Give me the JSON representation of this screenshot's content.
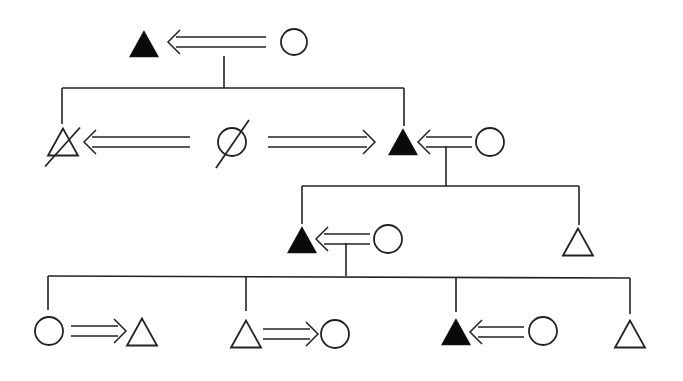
{
  "diagram": {
    "title": "",
    "type": "kinship-pedigree",
    "colors": {
      "stroke": "#222222",
      "filled": "#0a0a0a",
      "background": "#ffffff"
    },
    "nodes": [
      {
        "id": "g1-male",
        "shape": "triangle",
        "filled": true,
        "deceased": false,
        "cx": 144,
        "cy": 44,
        "size": 28
      },
      {
        "id": "g1-female",
        "shape": "circle",
        "filled": false,
        "deceased": false,
        "cx": 294,
        "cy": 42,
        "r": 13
      },
      {
        "id": "g2-male-left",
        "shape": "triangle",
        "filled": false,
        "deceased": true,
        "cx": 63,
        "cy": 142,
        "size": 30
      },
      {
        "id": "g2-female-mid",
        "shape": "circle",
        "filled": false,
        "deceased": true,
        "cx": 232,
        "cy": 142,
        "r": 14
      },
      {
        "id": "g2-male-right",
        "shape": "triangle",
        "filled": true,
        "deceased": false,
        "cx": 403,
        "cy": 142,
        "size": 28
      },
      {
        "id": "g2-female-right",
        "shape": "circle",
        "filled": false,
        "deceased": false,
        "cx": 490,
        "cy": 142,
        "r": 14
      },
      {
        "id": "g3-male-left",
        "shape": "triangle",
        "filled": true,
        "deceased": false,
        "cx": 302,
        "cy": 240,
        "size": 28
      },
      {
        "id": "g3-female-left",
        "shape": "circle",
        "filled": false,
        "deceased": false,
        "cx": 388,
        "cy": 239,
        "r": 14
      },
      {
        "id": "g3-male-right",
        "shape": "triangle",
        "filled": false,
        "deceased": false,
        "cx": 578,
        "cy": 242,
        "size": 30
      },
      {
        "id": "g4-female-1",
        "shape": "circle",
        "filled": false,
        "deceased": false,
        "cx": 49,
        "cy": 331,
        "r": 14
      },
      {
        "id": "g4-male-1",
        "shape": "triangle",
        "filled": false,
        "deceased": false,
        "cx": 142,
        "cy": 332,
        "size": 30
      },
      {
        "id": "g4-male-2",
        "shape": "triangle",
        "filled": false,
        "deceased": false,
        "cx": 246,
        "cy": 334,
        "size": 30
      },
      {
        "id": "g4-female-2",
        "shape": "circle",
        "filled": false,
        "deceased": false,
        "cx": 335,
        "cy": 334,
        "r": 14
      },
      {
        "id": "g4-male-3",
        "shape": "triangle",
        "filled": true,
        "deceased": false,
        "cx": 456,
        "cy": 332,
        "size": 28
      },
      {
        "id": "g4-female-3",
        "shape": "circle",
        "filled": false,
        "deceased": false,
        "cx": 543,
        "cy": 331,
        "r": 14
      },
      {
        "id": "g4-male-4",
        "shape": "triangle",
        "filled": false,
        "deceased": false,
        "cx": 630,
        "cy": 334,
        "size": 30
      }
    ],
    "arrows": [
      {
        "id": "arrow-g1",
        "direction": "left",
        "x1": 168,
        "x2": 266,
        "y": 42,
        "gap": 10
      },
      {
        "id": "arrow-g2-left",
        "direction": "left",
        "x1": 84,
        "x2": 190,
        "y": 142,
        "gap": 10
      },
      {
        "id": "arrow-g2-mid",
        "direction": "right",
        "x1": 268,
        "x2": 375,
        "y": 142,
        "gap": 10
      },
      {
        "id": "arrow-g2-right",
        "direction": "left",
        "x1": 418,
        "x2": 472,
        "y": 142,
        "gap": 10
      },
      {
        "id": "arrow-g3",
        "direction": "left",
        "x1": 316,
        "x2": 370,
        "y": 239,
        "gap": 10
      },
      {
        "id": "arrow-g4-1",
        "direction": "right",
        "x1": 71,
        "x2": 126,
        "y": 331,
        "gap": 10
      },
      {
        "id": "arrow-g4-2",
        "direction": "right",
        "x1": 263,
        "x2": 318,
        "y": 334,
        "gap": 10
      },
      {
        "id": "arrow-g4-3",
        "direction": "left",
        "x1": 470,
        "x2": 524,
        "y": 332,
        "gap": 10
      }
    ],
    "lines": [
      {
        "id": "g1-descent",
        "x1": 224,
        "y1": 56,
        "x2": 224,
        "y2": 88
      },
      {
        "id": "g1-sibline",
        "x1": 62,
        "y1": 88,
        "x2": 404,
        "y2": 88
      },
      {
        "id": "g1-drop-left",
        "x1": 62,
        "y1": 88,
        "x2": 62,
        "y2": 124
      },
      {
        "id": "g1-drop-right",
        "x1": 404,
        "y1": 88,
        "x2": 404,
        "y2": 126
      },
      {
        "id": "g2-descent",
        "x1": 446,
        "y1": 146,
        "x2": 446,
        "y2": 186
      },
      {
        "id": "g2-sibline",
        "x1": 302,
        "y1": 186,
        "x2": 579,
        "y2": 186
      },
      {
        "id": "g2-drop-left",
        "x1": 302,
        "y1": 186,
        "x2": 302,
        "y2": 224
      },
      {
        "id": "g2-drop-right",
        "x1": 579,
        "y1": 186,
        "x2": 579,
        "y2": 225
      },
      {
        "id": "g3-descent",
        "x1": 346,
        "y1": 243,
        "x2": 346,
        "y2": 276
      },
      {
        "id": "g3-sibline",
        "x1": 48,
        "y1": 276,
        "x2": 630,
        "y2": 278
      },
      {
        "id": "g3-drop-1",
        "x1": 48,
        "y1": 276,
        "x2": 48,
        "y2": 310
      },
      {
        "id": "g3-drop-2",
        "x1": 246,
        "y1": 277,
        "x2": 246,
        "y2": 311
      },
      {
        "id": "g3-drop-3",
        "x1": 456,
        "y1": 277,
        "x2": 456,
        "y2": 312
      },
      {
        "id": "g3-drop-4",
        "x1": 630,
        "y1": 278,
        "x2": 630,
        "y2": 314
      }
    ]
  }
}
